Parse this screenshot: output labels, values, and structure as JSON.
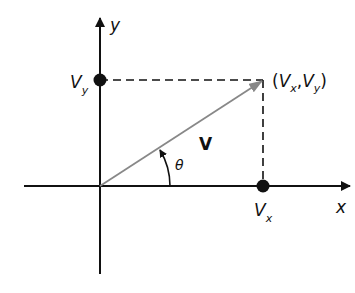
{
  "diagram": {
    "type": "vector-components",
    "colors": {
      "axis": "#111111",
      "vector": "#888888",
      "dashed": "#111111",
      "point": "#111111"
    },
    "axes": {
      "x_label": "x",
      "y_label": "y"
    },
    "vector": {
      "label": "V",
      "angle_label": "θ",
      "tip_label_open": "(",
      "tip_label_vx": "V",
      "tip_label_vx_sub": "x",
      "tip_label_comma": ",",
      "tip_label_vy": "V",
      "tip_label_vy_sub": "y",
      "tip_label_close": ")"
    },
    "components": {
      "vx_label": "V",
      "vx_sub": "x",
      "vy_label": "V",
      "vy_sub": "y"
    }
  }
}
